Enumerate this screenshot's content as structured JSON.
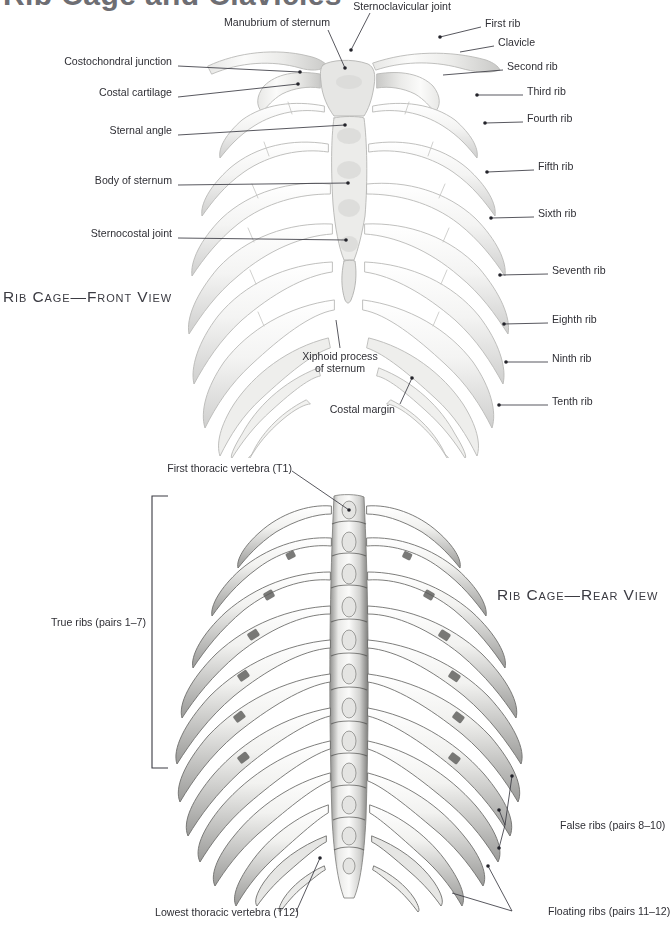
{
  "page": {
    "title": "Rib Cage and Clavicles",
    "background": "#ffffff",
    "title_color": "#6e6e73",
    "label_color": "#2f2f35",
    "leader_color": "#3a3a42"
  },
  "captions": {
    "front": "Rib Cage—Front View",
    "rear": "Rib Cage—Rear View"
  },
  "front_view": {
    "labels_left": [
      {
        "text": "Costochondral junction",
        "x": 172,
        "y": 61
      },
      {
        "text": "Costal cartilage",
        "x": 172,
        "y": 92
      },
      {
        "text": "Sternal angle",
        "x": 172,
        "y": 130
      },
      {
        "text": "Body of sternum",
        "x": 172,
        "y": 180
      },
      {
        "text": "Sternocostal joint",
        "x": 172,
        "y": 233
      }
    ],
    "labels_top": [
      {
        "text": "Manubrium of sternum",
        "x": 330,
        "y": 21
      },
      {
        "text": "Sternoclavicular joint",
        "x": 430,
        "y": 3
      }
    ],
    "labels_right": [
      {
        "text": "First rib",
        "x": 485,
        "y": 22
      },
      {
        "text": "Clavicle",
        "x": 498,
        "y": 41
      },
      {
        "text": "Second rib",
        "x": 507,
        "y": 65
      },
      {
        "text": "Third rib",
        "x": 527,
        "y": 90
      },
      {
        "text": "Fourth rib",
        "x": 527,
        "y": 117
      },
      {
        "text": "Fifth rib",
        "x": 538,
        "y": 165
      },
      {
        "text": "Sixth rib",
        "x": 538,
        "y": 212
      },
      {
        "text": "Seventh rib",
        "x": 552,
        "y": 269
      },
      {
        "text": "Eighth rib",
        "x": 552,
        "y": 318
      },
      {
        "text": "Ninth rib",
        "x": 552,
        "y": 357
      },
      {
        "text": "Tenth rib",
        "x": 552,
        "y": 400
      }
    ],
    "labels_bottom": [
      {
        "text": "Xiphoid process",
        "x": 370,
        "y": 357
      },
      {
        "text": "of sternum",
        "x": 370,
        "y": 369
      },
      {
        "text": "Costal margin",
        "x": 395,
        "y": 409
      }
    ]
  },
  "rear_view": {
    "labels": [
      {
        "text": "First thoracic vertebra (T1)",
        "x": 253,
        "y": 468
      },
      {
        "text": "True ribs (pairs 1–7)",
        "x": 140,
        "y": 622
      },
      {
        "text": "False ribs (pairs 8–10)",
        "x": 560,
        "y": 820
      },
      {
        "text": "Floating ribs (pairs 11–12)",
        "x": 562,
        "y": 917
      },
      {
        "text": "Lowest thoracic vertebra (T12)",
        "x": 222,
        "y": 918
      }
    ]
  },
  "icons": {
    "leader_dot": "leader-dot",
    "bracket": "true-ribs-bracket"
  }
}
